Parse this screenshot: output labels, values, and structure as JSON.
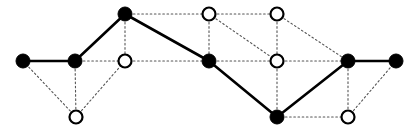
{
  "figure": {
    "width": 418,
    "height": 131,
    "background_color": "#ffffff"
  },
  "style": {
    "filled_node_fill": "#000000",
    "filled_node_stroke": "#000000",
    "open_node_fill": "#ffffff",
    "open_node_stroke": "#000000",
    "solid_edge_color": "#000000",
    "dotted_edge_color": "#555555",
    "filled_node_radius": 7,
    "open_node_radius": 6.5,
    "open_node_stroke_width": 2.2,
    "solid_edge_width": 2.6,
    "dotted_edge_width": 1.1,
    "dotted_edge_dash": "1.6,2.6"
  },
  "nodes": [
    {
      "id": "v1",
      "label": "v1",
      "type": "filled",
      "x": 23,
      "y": 61
    },
    {
      "id": "v2",
      "label": "v2",
      "type": "filled",
      "x": 75,
      "y": 61
    },
    {
      "id": "v3",
      "label": "v3",
      "type": "filled",
      "x": 125,
      "y": 14
    },
    {
      "id": "v4",
      "label": "v4",
      "type": "filled",
      "x": 209,
      "y": 61
    },
    {
      "id": "v5",
      "label": "v5",
      "type": "filled",
      "x": 277,
      "y": 117
    },
    {
      "id": "v6",
      "label": "v6",
      "type": "filled",
      "x": 348,
      "y": 61
    },
    {
      "id": "v7",
      "label": "v7",
      "type": "filled",
      "x": 396,
      "y": 61
    },
    {
      "id": "u1",
      "label": "u1",
      "type": "open",
      "x": 76,
      "y": 117
    },
    {
      "id": "u2",
      "label": "u2",
      "type": "open",
      "x": 125,
      "y": 61
    },
    {
      "id": "u3",
      "label": "u3",
      "type": "open",
      "x": 209,
      "y": 14
    },
    {
      "id": "u4",
      "label": "u4",
      "type": "open",
      "x": 277,
      "y": 14
    },
    {
      "id": "u5",
      "label": "u5",
      "type": "open",
      "x": 277,
      "y": 61
    },
    {
      "id": "u6",
      "label": "u6",
      "type": "open",
      "x": 348,
      "y": 117
    }
  ],
  "edges_solid": [
    {
      "from": "v1",
      "to": "v2"
    },
    {
      "from": "v2",
      "to": "v3"
    },
    {
      "from": "v3",
      "to": "v4"
    },
    {
      "from": "v4",
      "to": "v5"
    },
    {
      "from": "v5",
      "to": "v6"
    },
    {
      "from": "v6",
      "to": "v7"
    }
  ],
  "edges_dotted": [
    {
      "from": "v1",
      "to": "u1"
    },
    {
      "from": "v2",
      "to": "u1"
    },
    {
      "from": "v2",
      "to": "u2"
    },
    {
      "from": "u1",
      "to": "u2"
    },
    {
      "from": "v3",
      "to": "u2"
    },
    {
      "from": "u2",
      "to": "v4"
    },
    {
      "from": "v3",
      "to": "u3"
    },
    {
      "from": "u3",
      "to": "u4"
    },
    {
      "from": "u3",
      "to": "v4"
    },
    {
      "from": "u3",
      "to": "u5"
    },
    {
      "from": "u4",
      "to": "u5"
    },
    {
      "from": "u4",
      "to": "v6"
    },
    {
      "from": "v4",
      "to": "u5"
    },
    {
      "from": "u5",
      "to": "v6"
    },
    {
      "from": "u5",
      "to": "v5"
    },
    {
      "from": "v5",
      "to": "u6"
    },
    {
      "from": "u6",
      "to": "v6"
    },
    {
      "from": "u6",
      "to": "v7"
    }
  ]
}
